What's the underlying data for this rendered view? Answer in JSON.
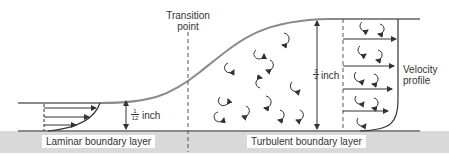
{
  "labels": {
    "transition": "Transition",
    "transition2": "point",
    "velocity": "Velocity",
    "velocity2": "profile",
    "laminar": "Laminar boundary layer",
    "turbulent": "Turbulent boundary layer",
    "laminar_thickness_num": "1",
    "laminar_thickness_den": "12",
    "laminar_thickness_unit": "inch",
    "turbulent_thickness_num": "3",
    "turbulent_thickness_den": "4",
    "turbulent_thickness_unit": "inch"
  },
  "colors": {
    "line": "#8a8a8a",
    "ground": "#d9d9d9",
    "ink": "#333333"
  }
}
